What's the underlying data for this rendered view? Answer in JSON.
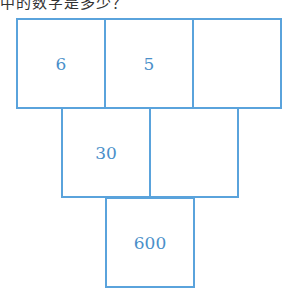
{
  "question_fragment": "中的数字是多少？",
  "pyramid": {
    "row1": [
      "6",
      "5",
      ""
    ],
    "row2": [
      "30",
      ""
    ],
    "row3": [
      "600"
    ]
  },
  "colors": {
    "line": "#5aa3dc",
    "text": "#4a8fc9"
  }
}
